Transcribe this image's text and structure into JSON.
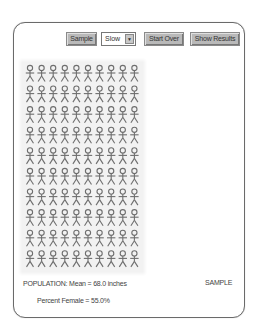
{
  "toolbar": {
    "sample_label": "Sample",
    "speed_value": "Slow",
    "start_over_label": "Start Over",
    "show_results_label": "Show Results"
  },
  "population_grid": {
    "rows": 10,
    "columns": 10,
    "icon": "stick-figure-icon",
    "figure_color": "#6e6e6e"
  },
  "footer": {
    "population_text": "POPULATION: Mean = 68.0 inches",
    "percent_female_text": "Percent Female = 55.0%",
    "sample_label": "SAMPLE"
  }
}
